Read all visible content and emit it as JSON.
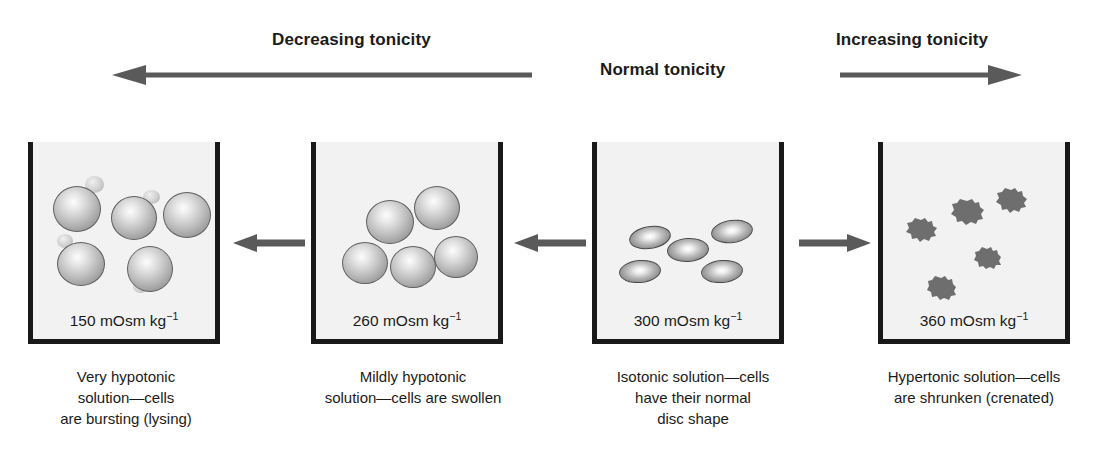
{
  "figure": {
    "background_color": "#ffffff",
    "beaker_fill_color": "#f2f2f2",
    "beaker_wall_color": "#191919",
    "arrow_color": "#5a5a5a",
    "text_color": "#1b1b1b"
  },
  "header": {
    "decreasing_label": "Decreasing tonicity",
    "normal_label": "Normal tonicity",
    "increasing_label": "Increasing tonicity",
    "decreasing_arrow_icon": "arrow-left-icon",
    "increasing_arrow_icon": "arrow-right-icon"
  },
  "beakers": [
    {
      "id": "very-hypotonic",
      "concentration_value": "150",
      "concentration_units": "mOsm kg",
      "concentration_exponent": "−1",
      "caption_lines": [
        "Very hypotonic",
        "solution—cells",
        "are bursting (lysing)"
      ],
      "cell_state": "bursting",
      "cell_count": 5
    },
    {
      "id": "mildly-hypotonic",
      "concentration_value": "260",
      "concentration_units": "mOsm kg",
      "concentration_exponent": "−1",
      "caption_lines": [
        "Mildly hypotonic",
        "solution—cells are swollen"
      ],
      "cell_state": "swollen",
      "cell_count": 5
    },
    {
      "id": "isotonic",
      "concentration_value": "300",
      "concentration_units": "mOsm kg",
      "concentration_exponent": "−1",
      "caption_lines": [
        "Isotonic solution—cells",
        "have their normal",
        "disc shape"
      ],
      "cell_state": "normal-disc",
      "cell_count": 5
    },
    {
      "id": "hypertonic",
      "concentration_value": "360",
      "concentration_units": "mOsm kg",
      "concentration_exponent": "−1",
      "caption_lines": [
        "Hypertonic solution—cells",
        "are shrunken (crenated)"
      ],
      "cell_state": "crenated",
      "cell_count": 5
    }
  ],
  "connectors": [
    {
      "id": "connector-300-to-260",
      "direction": "left",
      "icon": "arrow-left-icon"
    },
    {
      "id": "connector-300-to-150",
      "direction": "left",
      "icon": "arrow-left-icon"
    },
    {
      "id": "connector-300-to-360",
      "direction": "right",
      "icon": "arrow-right-icon"
    }
  ]
}
